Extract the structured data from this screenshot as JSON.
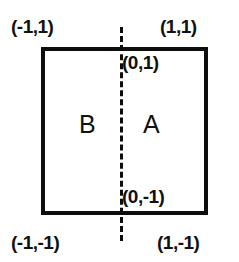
{
  "figure": {
    "type": "geometric-diagram",
    "colors": {
      "background": "#ffffff",
      "stroke": "#0d0d0d",
      "text": "#111111"
    },
    "shape": {
      "name": "square",
      "corner_labels": {
        "top_left": "(-1,1)",
        "top_right": "(1,1)",
        "bottom_left": "(-1,-1)",
        "bottom_right": "(1,-1)"
      }
    },
    "divider": {
      "style": "dashed",
      "orientation": "vertical",
      "top_label": "(0,1)",
      "bottom_label": "(0,-1)"
    },
    "regions": [
      {
        "id": "B",
        "label": "B",
        "side": "left"
      },
      {
        "id": "A",
        "label": "A",
        "side": "right"
      }
    ]
  }
}
